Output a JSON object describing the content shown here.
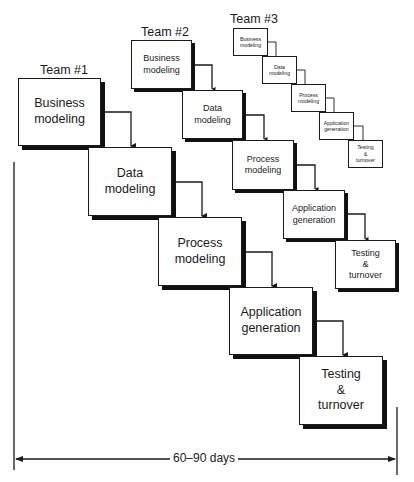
{
  "diagram": {
    "type": "overlapping-waterfall",
    "colors": {
      "line": "#1a1a1a",
      "shadow": "#111111",
      "background": "#ffffff"
    },
    "teams": [
      {
        "label": "Team #1",
        "phases": [
          {
            "line1": "Business",
            "line2": "modeling",
            "line3": ""
          },
          {
            "line1": "Data",
            "line2": "modeling",
            "line3": ""
          },
          {
            "line1": "Process",
            "line2": "modeling",
            "line3": ""
          },
          {
            "line1": "Application",
            "line2": "generation",
            "line3": ""
          },
          {
            "line1": "Testing",
            "line2": "&",
            "line3": "turnover"
          }
        ]
      },
      {
        "label": "Team #2",
        "phases": [
          {
            "line1": "Business",
            "line2": "modeling",
            "line3": ""
          },
          {
            "line1": "Data",
            "line2": "modeling",
            "line3": ""
          },
          {
            "line1": "Process",
            "line2": "modeling",
            "line3": ""
          },
          {
            "line1": "Application",
            "line2": "generation",
            "line3": ""
          },
          {
            "line1": "Testing",
            "line2": "&",
            "line3": "turnover"
          }
        ]
      },
      {
        "label": "Team #3",
        "phases": [
          {
            "line1": "Business",
            "line2": "modeling",
            "line3": ""
          },
          {
            "line1": "Data",
            "line2": "modeling",
            "line3": ""
          },
          {
            "line1": "Process",
            "line2": "modeling",
            "line3": ""
          },
          {
            "line1": "Application",
            "line2": "generation",
            "line3": ""
          },
          {
            "line1": "Testing",
            "line2": "&",
            "line3": "turnover"
          }
        ]
      }
    ],
    "timeline": {
      "label": "60–90 days"
    }
  }
}
